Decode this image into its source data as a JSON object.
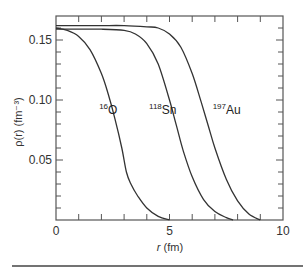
{
  "chart_data": {
    "type": "line",
    "title": "",
    "xlabel": "r (fm)",
    "ylabel": "ρ(r) (fm⁻³)",
    "xlim": [
      0,
      10
    ],
    "ylim": [
      0,
      0.17
    ],
    "x_ticks": [
      0,
      5,
      10
    ],
    "x_tick_labels": [
      "0",
      "5",
      "10"
    ],
    "x_minor_step": 1,
    "y_ticks": [
      0.05,
      0.1,
      0.15
    ],
    "y_tick_labels": [
      "0.05",
      "0.10",
      "0.15"
    ],
    "y_minor_step": 0.01,
    "grid": false,
    "legend": "inline labels",
    "series": [
      {
        "name": "16O",
        "label_mass": "16",
        "label_element": "O",
        "r": [
          0,
          0.5,
          1.0,
          1.5,
          2.0,
          2.3,
          2.6,
          2.9,
          3.1,
          3.3,
          3.6,
          4.0,
          4.5,
          5.0
        ],
        "rho": [
          0.16,
          0.158,
          0.153,
          0.142,
          0.122,
          0.105,
          0.084,
          0.06,
          0.04,
          0.03,
          0.02,
          0.01,
          0.003,
          0.0
        ]
      },
      {
        "name": "118Sn",
        "label_mass": "118",
        "label_element": "Sn",
        "r": [
          0,
          1,
          2,
          3,
          3.5,
          4.0,
          4.5,
          5.0,
          5.3,
          5.6,
          6.0,
          6.5,
          7.0,
          7.5,
          7.8
        ],
        "rho": [
          0.159,
          0.159,
          0.159,
          0.158,
          0.155,
          0.147,
          0.13,
          0.1,
          0.079,
          0.058,
          0.036,
          0.017,
          0.007,
          0.002,
          0.0
        ]
      },
      {
        "name": "197Au",
        "label_mass": "197",
        "label_element": "Au",
        "r": [
          0,
          1,
          2,
          3,
          4,
          4.5,
          5.0,
          5.5,
          6.0,
          6.4,
          6.7,
          7.0,
          7.5,
          8.0,
          8.5,
          9.0
        ],
        "rho": [
          0.162,
          0.162,
          0.162,
          0.162,
          0.161,
          0.16,
          0.155,
          0.144,
          0.122,
          0.098,
          0.079,
          0.06,
          0.034,
          0.016,
          0.005,
          0.0
        ]
      }
    ],
    "annotations": [
      {
        "text": "16O",
        "r": 1.9,
        "rho": 0.092
      },
      {
        "text": "118Sn",
        "r": 4.1,
        "rho": 0.092
      },
      {
        "text": "197Au",
        "r": 6.9,
        "rho": 0.092
      }
    ]
  }
}
